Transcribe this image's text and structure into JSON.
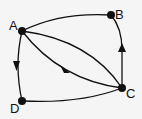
{
  "diagram": {
    "type": "directed-graph",
    "nodes": [
      {
        "id": "A",
        "label": "A",
        "x": 22,
        "y": 31
      },
      {
        "id": "B",
        "label": "B",
        "x": 111,
        "y": 15
      },
      {
        "id": "C",
        "label": "C",
        "x": 122,
        "y": 88
      },
      {
        "id": "D",
        "label": "D",
        "x": 22,
        "y": 101
      }
    ],
    "edges": [
      {
        "from": "A",
        "to": "B",
        "directed": false
      },
      {
        "from": "A",
        "to": "D",
        "directed": true
      },
      {
        "from": "A",
        "to": "C",
        "directed": true,
        "curve": "lower"
      },
      {
        "from": "A",
        "to": "C",
        "directed": false,
        "curve": "upper"
      },
      {
        "from": "C",
        "to": "B",
        "directed": true
      },
      {
        "from": "D",
        "to": "C",
        "directed": false
      }
    ],
    "colors": {
      "stroke": "#111111",
      "background": "#f5f5f5"
    }
  }
}
